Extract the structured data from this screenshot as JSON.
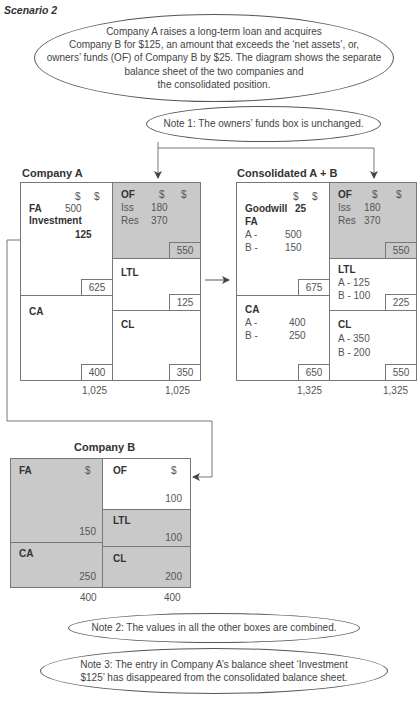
{
  "scenario_label": "Scenario 2",
  "intro_text": "Company A raises a long-term loan and acquires Company B for $125, an amount that exceeds the ‘net assets’, or, owners’ funds (OF) of Company B by $25. The diagram shows the separate balance sheet of the two companies and the consolidated position.",
  "intro_lines": [
    "Company A raises a long-term loan and acquires",
    "Company B for $125, an amount that exceeds the ‘net assets’, or,",
    "owners’ funds (OF) of Company B by $25. The diagram shows the separate",
    "balance sheet of the two companies and",
    "the consolidated position."
  ],
  "notes": {
    "note1": "Note 1: The owners’ funds box is unchanged.",
    "note2": "Note 2: The values in all the other boxes are combined.",
    "note3_line1": "Note 3: The entry in Company A’s balance sheet ‘Investment",
    "note3_line2": "$125’ has disappeared from the consolidated balance sheet."
  },
  "company_a": {
    "title": "Company A",
    "currency_left": "$",
    "currency_right": "$",
    "fa": {
      "label": "FA",
      "value": "500"
    },
    "investment": {
      "label": "Investment",
      "value": "125"
    },
    "assets_fixed_total": "625",
    "ca": {
      "label": "CA",
      "total": "400"
    },
    "of": {
      "label": "OF",
      "cur1": "$",
      "cur2": "$",
      "iss_label": "Iss",
      "iss": "180",
      "res_label": "Res",
      "res": "370",
      "total": "550"
    },
    "ltl": {
      "label": "LTL",
      "total": "125"
    },
    "cl": {
      "label": "CL",
      "total": "350"
    },
    "total_assets": "1,025",
    "total_liabilities": "1,025"
  },
  "consolidated": {
    "title": "Consolidated A + B",
    "currency_left": "$",
    "currency_right": "$",
    "goodwill": {
      "label": "Goodwill",
      "value": "25"
    },
    "fa": {
      "label": "FA",
      "a_label": "A -",
      "a": "500",
      "b_label": "B -",
      "b": "150"
    },
    "fixed_total": "675",
    "ca": {
      "label": "CA",
      "a_label": "A -",
      "a": "400",
      "b_label": "B -",
      "b": "250",
      "total": "650"
    },
    "of": {
      "label": "OF",
      "cur1": "$",
      "cur2": "$",
      "iss_label": "Iss",
      "iss": "180",
      "res_label": "Res",
      "res": "370",
      "total": "550"
    },
    "ltl": {
      "label": "LTL",
      "a": "A - 125",
      "b": "B - 100",
      "total": "225"
    },
    "cl": {
      "label": "CL",
      "a": "A - 350",
      "b": "B - 200",
      "total": "550"
    },
    "total_assets": "1,325",
    "total_liabilities": "1,325"
  },
  "company_b": {
    "title": "Company B",
    "fa": {
      "label": "FA",
      "cur": "$",
      "value": "150"
    },
    "ca": {
      "label": "CA",
      "value": "250"
    },
    "of": {
      "label": "OF",
      "cur": "$",
      "value": "100"
    },
    "ltl": {
      "label": "LTL",
      "value": "100"
    },
    "cl": {
      "label": "CL",
      "value": "200"
    },
    "total_assets": "400",
    "total_liabilities": "400"
  },
  "colors": {
    "shade": "#c9c9c9",
    "line": "#777777",
    "text": "#444444"
  }
}
